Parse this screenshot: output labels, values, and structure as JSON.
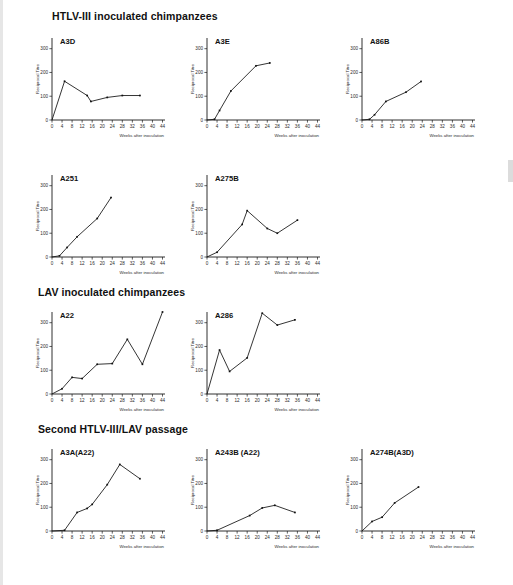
{
  "figure": {
    "axis_titles": {
      "x": "Weeks after inoculation",
      "y": "Reciprocal Titre"
    },
    "x_ticks": [
      0,
      4,
      8,
      12,
      16,
      20,
      24,
      28,
      32,
      36,
      40,
      44
    ],
    "y_ticks": [
      0,
      100,
      200,
      300
    ],
    "xlim": [
      0,
      45
    ],
    "ylim": [
      0,
      345
    ],
    "line_color": "#111111",
    "axis_color": "#1a1a1a"
  },
  "sections": [
    {
      "id": "section-htlv3",
      "label": "HTLV-III inoculated chimpanzees"
    },
    {
      "id": "section-lav",
      "label": "LAV inoculated chimpanzees"
    },
    {
      "id": "section-passage",
      "label": "Second HTLV-III/LAV passage"
    }
  ],
  "chart_data": [
    {
      "type": "line",
      "id": "chart-a3d",
      "title": "A3D",
      "xlabel": "Weeks after inoculation",
      "ylabel": "Reciprocal Titre",
      "xlim": [
        0,
        45
      ],
      "ylim": [
        0,
        345
      ],
      "grid": false,
      "x": [
        0,
        5,
        14,
        15.5,
        22,
        28,
        35
      ],
      "values": [
        0,
        163,
        103,
        78,
        95,
        103,
        103
      ]
    },
    {
      "type": "line",
      "id": "chart-a3e",
      "title": "A3E",
      "xlabel": "Weeks after inoculation",
      "ylabel": "Reciprocal Titre",
      "xlim": [
        0,
        45
      ],
      "ylim": [
        0,
        345
      ],
      "grid": false,
      "x": [
        0,
        3,
        5,
        9.5,
        19.5,
        25
      ],
      "values": [
        0,
        3,
        40,
        122,
        228,
        240
      ]
    },
    {
      "type": "line",
      "id": "chart-a86b",
      "title": "A86B",
      "xlabel": "Weeks after inoculation",
      "ylabel": "Reciprocal Titre",
      "xlim": [
        0,
        45
      ],
      "ylim": [
        0,
        345
      ],
      "grid": false,
      "x": [
        0,
        3,
        5,
        9.5,
        17.5,
        23.5
      ],
      "values": [
        0,
        3,
        22,
        78,
        117,
        162
      ]
    },
    {
      "type": "line",
      "id": "chart-a251",
      "title": "A251",
      "xlabel": "Weeks after inoculation",
      "ylabel": "Reciprocal Titre",
      "xlim": [
        0,
        45
      ],
      "ylim": [
        0,
        345
      ],
      "grid": false,
      "x": [
        0,
        3,
        6,
        10,
        18,
        23.5
      ],
      "values": [
        0,
        5,
        40,
        85,
        162,
        250
      ]
    },
    {
      "type": "line",
      "id": "chart-a275b",
      "title": "A275B",
      "xlabel": "Weeks after inoculation",
      "ylabel": "Reciprocal Titre",
      "xlim": [
        0,
        45
      ],
      "ylim": [
        0,
        345
      ],
      "grid": false,
      "x": [
        0,
        4,
        14,
        16,
        24,
        28,
        36
      ],
      "values": [
        0,
        20,
        137,
        195,
        120,
        100,
        155
      ]
    },
    {
      "type": "line",
      "id": "chart-a22",
      "title": "A22",
      "xlabel": "Weeks after inoculation",
      "ylabel": "Reciprocal Titre",
      "xlim": [
        0,
        45
      ],
      "ylim": [
        0,
        345
      ],
      "grid": false,
      "x": [
        0,
        4,
        8,
        12,
        18,
        24,
        30,
        36,
        44
      ],
      "values": [
        0,
        22,
        70,
        65,
        125,
        128,
        230,
        125,
        345
      ]
    },
    {
      "type": "line",
      "id": "chart-a286",
      "title": "A286",
      "xlabel": "Weeks after inoculation",
      "ylabel": "Reciprocal Titre",
      "xlim": [
        0,
        45
      ],
      "ylim": [
        0,
        345
      ],
      "grid": false,
      "x": [
        0,
        5,
        9,
        16,
        22,
        28,
        35
      ],
      "values": [
        0,
        185,
        95,
        152,
        340,
        290,
        312
      ]
    },
    {
      "type": "line",
      "id": "chart-a3a-a22",
      "title": "A3A(A22)",
      "xlabel": "Weeks after inoculation",
      "ylabel": "Reciprocal Titre",
      "xlim": [
        0,
        45
      ],
      "ylim": [
        0,
        345
      ],
      "grid": false,
      "x": [
        0,
        5,
        10,
        14,
        16,
        22,
        27,
        35
      ],
      "values": [
        0,
        3,
        78,
        95,
        112,
        195,
        280,
        220
      ]
    },
    {
      "type": "line",
      "id": "chart-a243b-a22",
      "title": "A243B (A22)",
      "xlabel": "Weeks after inoculation",
      "ylabel": "Reciprocal Titre",
      "xlim": [
        0,
        45
      ],
      "ylim": [
        0,
        345
      ],
      "grid": false,
      "x": [
        0,
        4,
        17,
        22,
        27,
        35
      ],
      "values": [
        0,
        3,
        65,
        97,
        108,
        78
      ]
    },
    {
      "type": "line",
      "id": "chart-a274b-a3d",
      "title": "A274B(A3D)",
      "xlabel": "Weeks after inoculation",
      "ylabel": "Reciprocal Titre",
      "xlim": [
        0,
        45
      ],
      "ylim": [
        0,
        345
      ],
      "grid": false,
      "x": [
        0,
        4,
        8,
        13,
        22.5
      ],
      "values": [
        0,
        40,
        58,
        118,
        185
      ]
    }
  ],
  "layout": {
    "panels": [
      {
        "chart": 0,
        "left": 28,
        "top": 26,
        "section": 0
      },
      {
        "chart": 1,
        "left": 183,
        "top": 26,
        "section": null
      },
      {
        "chart": 2,
        "left": 338,
        "top": 26,
        "section": null
      },
      {
        "chart": 3,
        "left": 28,
        "top": 163,
        "section": null
      },
      {
        "chart": 4,
        "left": 183,
        "top": 163,
        "section": null
      },
      {
        "chart": 5,
        "left": 28,
        "top": 300,
        "section": 1
      },
      {
        "chart": 6,
        "left": 183,
        "top": 300,
        "section": null
      },
      {
        "chart": 7,
        "left": 28,
        "top": 437,
        "section": 2
      },
      {
        "chart": 8,
        "left": 183,
        "top": 437,
        "section": null
      },
      {
        "chart": 9,
        "left": 338,
        "top": 437,
        "section": null
      }
    ],
    "section_positions": [
      {
        "left": 52,
        "top": 10
      },
      {
        "left": 38,
        "top": 286
      },
      {
        "left": 38,
        "top": 423
      }
    ],
    "panel_size": {
      "w": 143,
      "h": 118
    }
  }
}
